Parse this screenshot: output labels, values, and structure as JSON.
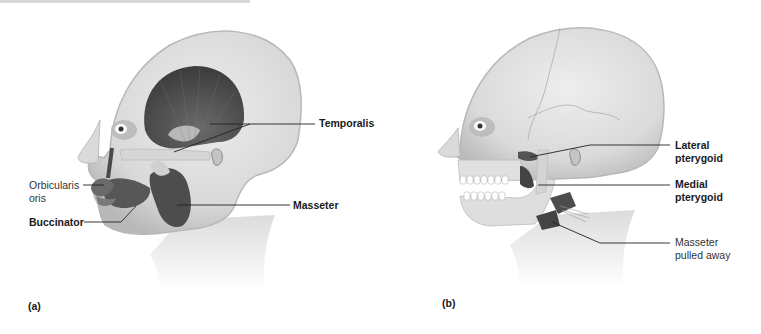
{
  "figure": {
    "panels": [
      {
        "id": "a",
        "tag": "(a)",
        "description": "Lateral view of head showing superficial muscles of mastication and facial muscles",
        "labels": [
          {
            "text_lines": [
              "Temporalis"
            ],
            "weight": "bold"
          },
          {
            "text_lines": [
              "Masseter"
            ],
            "weight": "bold"
          },
          {
            "text_lines": [
              "Orbicularis",
              "oris"
            ],
            "weight": "normal"
          },
          {
            "text_lines": [
              "Buccinator"
            ],
            "weight": "bold"
          }
        ]
      },
      {
        "id": "b",
        "tag": "(b)",
        "description": "Lateral view of skull with masseter pulled away to reveal deep muscles",
        "labels": [
          {
            "text_lines": [
              "Lateral",
              "pterygoid"
            ],
            "weight": "bold"
          },
          {
            "text_lines": [
              "Medial",
              "pterygoid"
            ],
            "weight": "bold"
          },
          {
            "text_lines": [
              "Masseter",
              "pulled away"
            ],
            "weight": "normal"
          }
        ]
      }
    ],
    "colors": {
      "skin": "#e4e4e4",
      "skin_shadow": "#c9c9c9",
      "muscle": "#5a5a5a",
      "muscle_dark": "#3f3f3f",
      "tendon": "#d2d2d2",
      "leader_line": "#222222",
      "text": "#1a1a1a"
    }
  }
}
